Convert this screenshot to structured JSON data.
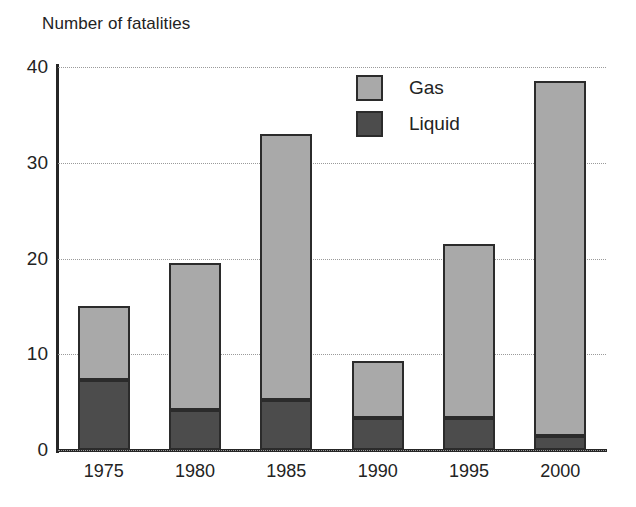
{
  "chart_data": {
    "type": "bar",
    "title": "Number of fatalities",
    "subtitle": "",
    "xlabel": "",
    "ylabel": "Number of fatalities",
    "stacked": true,
    "orientation": "vertical",
    "grid": true,
    "grid_axis": "y",
    "legend_position": "inside-top-center",
    "categories": [
      "1975",
      "1980",
      "1985",
      "1990",
      "1995",
      "2000"
    ],
    "ylim": [
      0,
      40
    ],
    "yticks": [
      0,
      10,
      20,
      30,
      40
    ],
    "ytick_labels": [
      "0",
      "10",
      "20",
      "30",
      "40"
    ],
    "series": [
      {
        "name": "Liquid",
        "color": "#4c4c4c",
        "values": [
          7.3,
          4.2,
          5.2,
          3.3,
          3.3,
          1.5
        ]
      },
      {
        "name": "Gas",
        "color": "#a9a9a9",
        "values": [
          7.7,
          15.3,
          27.8,
          6.0,
          18.2,
          37.0
        ]
      }
    ],
    "stack_order_bottom_to_top": [
      "Liquid",
      "Gas"
    ],
    "totals": [
      15.0,
      19.5,
      33.0,
      9.3,
      21.5,
      38.5
    ],
    "annotations": []
  },
  "legend": {
    "entries": [
      {
        "label": "Gas",
        "color": "#a9a9a9"
      },
      {
        "label": "Liquid",
        "color": "#4c4c4c"
      }
    ]
  },
  "colors": {
    "gas": "#a9a9a9",
    "liquid": "#4c4c4c",
    "axis": "#262626",
    "grid": "#9a9a9a",
    "bar_outline": "#2b2b2b",
    "text": "#232323",
    "background": "#ffffff"
  }
}
